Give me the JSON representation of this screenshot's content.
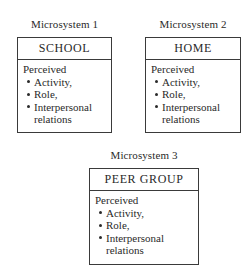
{
  "microsystems": [
    {
      "caption": "Microsystem 1",
      "setting": "SCHOOL",
      "heading": "Perceived",
      "items": [
        "Activity,",
        "Role,",
        "Interpersonal"
      ],
      "continuation": "relations"
    },
    {
      "caption": "Microsystem 2",
      "setting": "HOME",
      "heading": "Perceived",
      "items": [
        "Activity,",
        "Role,",
        "Interpersonal"
      ],
      "continuation": "relations"
    },
    {
      "caption": "Microsystem 3",
      "setting": "PEER GROUP",
      "heading": "Perceived",
      "items": [
        "Activity,",
        "Role,",
        "Interpersonal"
      ],
      "continuation": "relations"
    }
  ]
}
